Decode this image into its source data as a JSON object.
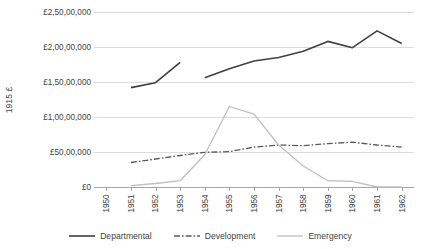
{
  "chart_data": {
    "type": "line",
    "title": "",
    "xlabel": "",
    "ylabel": "1915 £",
    "categories": [
      "1950",
      "1951",
      "1952",
      "1953",
      "1954",
      "1955",
      "1956",
      "1957",
      "1958",
      "1959",
      "1960",
      "1961",
      "1962"
    ],
    "ylim": [
      0,
      25000000
    ],
    "ytick_values": [
      0,
      5000000,
      10000000,
      15000000,
      20000000,
      25000000
    ],
    "ytick_labels": [
      "£0",
      "£50,00,000",
      "£1,00,00,000",
      "£1,50,00,000",
      "£2,00,00,000",
      "£2,50,00,000"
    ],
    "grid": true,
    "legend_position": "bottom",
    "series": [
      {
        "name": "Departmental",
        "color": "#404040",
        "style": "solid",
        "width": 1.6,
        "values": [
          null,
          14200000,
          14900000,
          17800000,
          15600000,
          16900000,
          18000000,
          18500000,
          19400000,
          20800000,
          19900000,
          22300000,
          20500000
        ]
      },
      {
        "name": "Development",
        "color": "#595959",
        "style": "dash-dot",
        "width": 1.3,
        "values": [
          null,
          3500000,
          4000000,
          4500000,
          4950000,
          5050000,
          5700000,
          6000000,
          5900000,
          6200000,
          6400000,
          6000000,
          5700000
        ]
      },
      {
        "name": "Emergency",
        "color": "#bfbfbf",
        "style": "solid",
        "width": 1.3,
        "values": [
          null,
          200000,
          500000,
          900000,
          4600000,
          11500000,
          10400000,
          6000000,
          3000000,
          900000,
          800000,
          0,
          0
        ]
      }
    ]
  },
  "legend": {
    "items": [
      {
        "label": "Departmental"
      },
      {
        "label": "Development"
      },
      {
        "label": "Emergency"
      }
    ]
  }
}
